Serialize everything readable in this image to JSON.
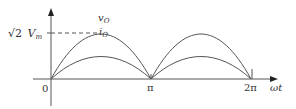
{
  "diagram": {
    "y_axis": {
      "peak_label_prefix": "√2",
      "peak_label_var": "V",
      "peak_label_sub": "m"
    },
    "x_axis": {
      "label": "ωt",
      "ticks": [
        "0",
        "π",
        "2π"
      ]
    },
    "curves": [
      {
        "name": "v",
        "sub": "O",
        "role": "output voltage",
        "relative_peak": 1.0
      },
      {
        "name": "i",
        "sub": "O",
        "role": "output current",
        "relative_peak": 0.5
      }
    ],
    "colors": {
      "stroke": "#555555",
      "text": "#333333",
      "background": "#ffffff"
    }
  }
}
